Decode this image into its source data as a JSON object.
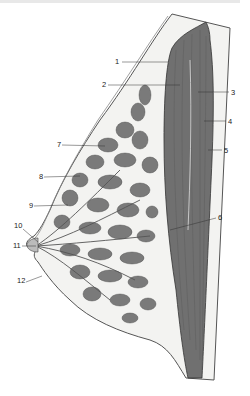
{
  "diagram": {
    "type": "anatomical cross-section (sagittal view of breast)",
    "colors": {
      "gland": "#7a7a7a",
      "muscle": "#6e6e6e",
      "fat": "#f2f2f0",
      "outline": "#444444",
      "background": "#ffffff"
    },
    "labels": [
      {
        "id": "1",
        "text": "1",
        "x": 118,
        "y": 61
      },
      {
        "id": "2",
        "text": "2",
        "x": 103,
        "y": 84
      },
      {
        "id": "3",
        "text": "3",
        "x": 231,
        "y": 92
      },
      {
        "id": "4",
        "text": "4",
        "x": 228,
        "y": 121
      },
      {
        "id": "5",
        "text": "5",
        "x": 224,
        "y": 150
      },
      {
        "id": "6",
        "text": "6",
        "x": 218,
        "y": 217
      },
      {
        "id": "7",
        "text": "7",
        "x": 57,
        "y": 144
      },
      {
        "id": "8",
        "text": "8",
        "x": 39,
        "y": 176
      },
      {
        "id": "9",
        "text": "9",
        "x": 29,
        "y": 205
      },
      {
        "id": "10",
        "text": "10",
        "x": 16,
        "y": 225
      },
      {
        "id": "11",
        "text": "11",
        "x": 15,
        "y": 245
      },
      {
        "id": "12",
        "text": "12",
        "x": 19,
        "y": 280
      }
    ]
  }
}
